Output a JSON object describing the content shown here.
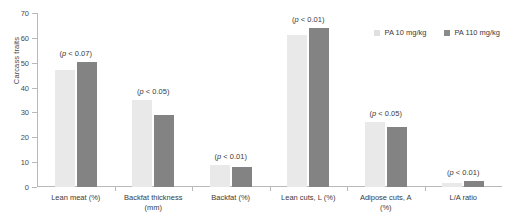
{
  "chart_data": {
    "type": "bar",
    "title": "",
    "xlabel": "",
    "ylabel": "Carcass traits",
    "ylim": [
      0,
      70
    ],
    "yticks": [
      0,
      10,
      20,
      30,
      40,
      50,
      60,
      70
    ],
    "grid": false,
    "legend_position": "top-right",
    "categories": [
      "Lean meat (%)",
      "Backfat thickness (mm)",
      "Backfat (%)",
      "Lean cuts, L (%)",
      "Adipose cuts, A (%)",
      "L/A ratio"
    ],
    "series": [
      {
        "name": "PA 10 mg/kg",
        "color": "#e9e9e9",
        "values": [
          47.0,
          35.0,
          9.0,
          61.0,
          26.0,
          1.8
        ]
      },
      {
        "name": "PA 110 mg/kg",
        "color": "#838383",
        "values": [
          50.2,
          29.0,
          8.0,
          64.0,
          24.2,
          2.5
        ]
      }
    ],
    "annotations": [
      {
        "category": "Lean meat (%)",
        "text": "(p < 0.07)",
        "p_symbol": "p",
        "p_text": " < 0.07)"
      },
      {
        "category": "Backfat thickness (mm)",
        "text": "(p < 0.05)",
        "p_symbol": "p",
        "p_text": " < 0.05)"
      },
      {
        "category": "Backfat (%)",
        "text": "(p < 0.01)",
        "p_symbol": "p",
        "p_text": " < 0.01)"
      },
      {
        "category": "Lean cuts, L (%)",
        "text": "(p < 0.01)",
        "p_symbol": "p",
        "p_text": " < 0.01)"
      },
      {
        "category": "Adipose cuts, A (%)",
        "text": "(p < 0.05)",
        "p_symbol": "p",
        "p_text": " < 0.05)"
      },
      {
        "category": "L/A ratio",
        "text": "(p < 0.01)",
        "p_symbol": "p",
        "p_text": " < 0.01)"
      }
    ]
  },
  "axis": {
    "y_title": "Carcass traits",
    "tick_labels": [
      "0",
      "10",
      "20",
      "30",
      "40",
      "50",
      "60",
      "70"
    ]
  },
  "legend": {
    "items": [
      {
        "label": "PA 10 mg/kg"
      },
      {
        "label": "PA 110 mg/kg"
      }
    ]
  },
  "category_labels": [
    {
      "line1": "Lean meat (%)",
      "line2": ""
    },
    {
      "line1": "Backfat thickness",
      "line2": "(mm)"
    },
    {
      "line1": "Backfat (%)",
      "line2": ""
    },
    {
      "line1": "Lean cuts, L (%)",
      "line2": ""
    },
    {
      "line1": "Adipose cuts, A",
      "line2": "(%)"
    },
    {
      "line1": "L/A ratio",
      "line2": ""
    }
  ],
  "annotation_text": [
    "(p < 0.07)",
    "(p < 0.05)",
    "(p < 0.01)",
    "(p < 0.01)",
    "(p < 0.05)",
    "(p < 0.01)"
  ]
}
